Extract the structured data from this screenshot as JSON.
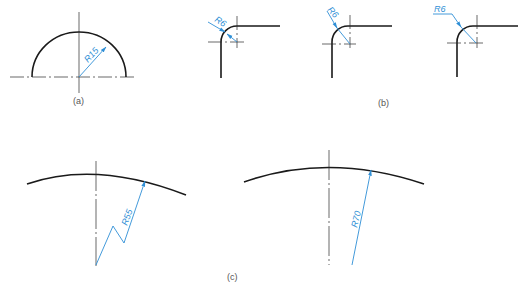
{
  "figure": {
    "panels": [
      {
        "id": "a",
        "caption": "(a)",
        "dimension": "R15",
        "description": "semicircle with radius dimension from center"
      },
      {
        "id": "b",
        "caption": "(b)",
        "dimensions": [
          "R6",
          "R6",
          "R6"
        ],
        "description": "three rounded corners with small radius dimension styles"
      },
      {
        "id": "c",
        "caption": "(c)",
        "dimensions": [
          "R55",
          "R70"
        ],
        "description": "large radius arcs with zigzag foreshortened leader and long leader"
      }
    ],
    "colors": {
      "outline": "#1a1a1a",
      "dimension": "#2f8fd6",
      "background": "#ffffff"
    }
  },
  "labels": {
    "a_caption": "(a)",
    "b_caption": "(b)",
    "c_caption": "(c)",
    "a_dim": "R15",
    "b1_dim": "R6",
    "b2_dim": "R6",
    "b3_dim": "R6",
    "c1_dim": "R55",
    "c2_dim": "R70"
  }
}
